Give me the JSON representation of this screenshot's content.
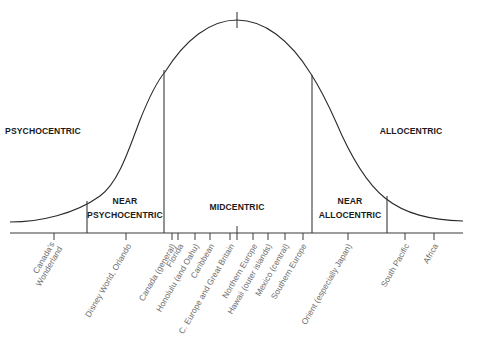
{
  "diagram": {
    "type": "bell-curve",
    "segments": [
      {
        "id": "psychocentric",
        "lines": [
          "PSYCHOCENTRIC"
        ],
        "x": 42,
        "y": 123
      },
      {
        "id": "near-psychocentric",
        "lines": [
          "NEAR",
          "PSYCHOCENTRIC"
        ],
        "x": 125,
        "y": 202
      },
      {
        "id": "midcentric",
        "lines": [
          "MIDCENTRIC"
        ],
        "x": 237,
        "y": 202
      },
      {
        "id": "near-allocentric",
        "lines": [
          "NEAR",
          "ALLOCENTRIC"
        ],
        "x": 350,
        "y": 202
      },
      {
        "id": "allocentric",
        "lines": [
          "ALLOCENTRIC"
        ],
        "x": 411,
        "y": 123
      }
    ],
    "segment_label_1": "PSYCHOCENTRIC",
    "segment_label_2a": "NEAR",
    "segment_label_2b": "PSYCHOCENTRIC",
    "segment_label_3": "MIDCENTRIC",
    "segment_label_4a": "NEAR",
    "segment_label_4b": "ALLOCENTRIC",
    "segment_label_5": "ALLOCENTRIC",
    "destinations": [
      {
        "label": "Canada's Wonderland",
        "lines": [
          "Canada's",
          "Wonderland"
        ],
        "x": 54
      },
      {
        "label": "Disney World, Orlando",
        "lines": [
          "Disney World, Orlando"
        ],
        "x": 126
      },
      {
        "label": "Canada (general)",
        "lines": [
          "Canada (general)"
        ],
        "x": 172
      },
      {
        "label": "Florida",
        "lines": [
          "Florida"
        ],
        "x": 178
      },
      {
        "label": "Honolulu (and Oahu)",
        "lines": [
          "Honolulu (and Oahu)"
        ],
        "x": 195
      },
      {
        "label": "Caribbean",
        "lines": [
          "Caribbean"
        ],
        "x": 210
      },
      {
        "label": "C. Europe and Great Britain",
        "lines": [
          "C. Europe and Great Britain"
        ],
        "x": 230
      },
      {
        "label": "Northern Europe",
        "lines": [
          "Northern Europe"
        ],
        "x": 253
      },
      {
        "label": "Hawaii (outer islands)",
        "lines": [
          "Hawaii (outer islands)"
        ],
        "x": 268
      },
      {
        "label": "Mexico (central)",
        "lines": [
          "Mexico (central)"
        ],
        "x": 285
      },
      {
        "label": "Southern Europe",
        "lines": [
          "Southern Europe"
        ],
        "x": 303
      },
      {
        "label": "Orient (especially Japan)",
        "lines": [
          "Orient (especially Japan)"
        ],
        "x": 348
      },
      {
        "label": "South Pacific",
        "lines": [
          "South Pacific"
        ],
        "x": 405
      },
      {
        "label": "Africa",
        "lines": [
          "Africa"
        ],
        "x": 434
      }
    ],
    "dest_0a": "Canada's",
    "dest_0b": "Wonderland",
    "dest_1": "Disney World, Orlando",
    "dest_2": "Canada (general)",
    "dest_3": "Florida",
    "dest_4": "Honolulu (and Oahu)",
    "dest_5": "Caribbean",
    "dest_6": "C. Europe and Great Britain",
    "dest_7": "Northern Europe",
    "dest_8": "Hawaii (outer islands)",
    "dest_9": "Mexico (central)",
    "dest_10": "Southern Europe",
    "dest_11": "Orient (especially Japan)",
    "dest_12": "South Pacific",
    "dest_13": "Africa",
    "colors": {
      "line": "#2a2a2a",
      "label": "#1a1a1a",
      "dest_text": "#6a6a6a",
      "background": "#ffffff"
    }
  }
}
